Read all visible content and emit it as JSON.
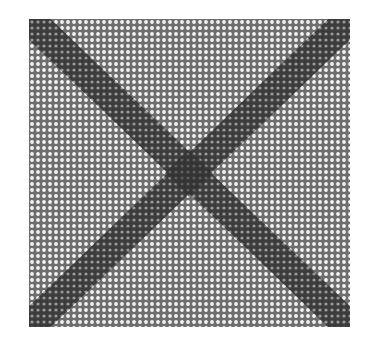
{
  "figure": {
    "grid": {
      "pitch": 6,
      "dot_radius": 1.9,
      "background": "#6e6e6e",
      "dot_color": "#f4f4f4"
    },
    "bands": {
      "width": 30,
      "color": "#3c3c3c",
      "dot_color": "#9a9a9a"
    },
    "center_blob": {
      "size": 34,
      "color": "#2e2e2e"
    }
  }
}
